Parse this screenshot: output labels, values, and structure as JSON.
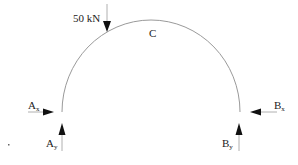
{
  "diagram": {
    "type": "semicircular-arch-free-body",
    "colors": {
      "arch": "#9a9a9a",
      "arrow": "#111111",
      "arrow_line": "#b0b0b0",
      "text": "#222222"
    },
    "load": {
      "label": "50 kN",
      "direction": "down"
    },
    "crown": {
      "label": "C"
    },
    "reactions": {
      "ax": {
        "base": "A",
        "sub": "x",
        "direction": "right"
      },
      "ay": {
        "base": "A",
        "sub": "y",
        "direction": "up"
      },
      "bx": {
        "base": "B",
        "sub": "x",
        "direction": "left"
      },
      "by": {
        "base": "B",
        "sub": "y",
        "direction": "up"
      }
    }
  }
}
